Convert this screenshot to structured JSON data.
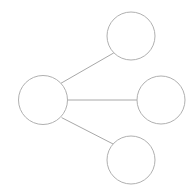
{
  "canvas": {
    "width": 191,
    "height": 196,
    "background_color": "#ffffff",
    "title": "node-link diagram"
  },
  "style": {
    "node_stroke_color": "#b0b0b0",
    "node_fill_color": "#ffffff",
    "node_stroke_width": 1,
    "edge_stroke_color": "#a8a8a8",
    "edge_stroke_width": 1
  },
  "graph": {
    "type": "node-link",
    "layout": "star",
    "node_count": 4,
    "edge_count": 3,
    "nodes": [
      {
        "id": "hub",
        "label": "",
        "shape": "circle",
        "cx": 43,
        "cy": 100,
        "r": 24.5,
        "role": "hub"
      },
      {
        "id": "top",
        "label": "",
        "shape": "circle",
        "cx": 131,
        "cy": 36,
        "r": 24,
        "role": "leaf"
      },
      {
        "id": "right",
        "label": "",
        "shape": "circle",
        "cx": 161,
        "cy": 100,
        "r": 24,
        "role": "leaf"
      },
      {
        "id": "bottom",
        "label": "",
        "shape": "circle",
        "cx": 131,
        "cy": 160,
        "r": 24,
        "role": "leaf"
      }
    ],
    "edges": [
      {
        "id": "edge-hub-top",
        "source": "hub",
        "target": "top",
        "label": "",
        "x1": 60.9,
        "y1": 83.3,
        "x2": 113.8,
        "y2": 52.9
      },
      {
        "id": "edge-hub-right",
        "source": "hub",
        "target": "right",
        "label": "",
        "x1": 67.5,
        "y1": 100,
        "x2": 137,
        "y2": 100
      },
      {
        "id": "edge-hub-bottom",
        "source": "hub",
        "target": "bottom",
        "label": "",
        "x1": 61.6,
        "y1": 117.6,
        "x2": 113.3,
        "y2": 144.1
      }
    ]
  }
}
